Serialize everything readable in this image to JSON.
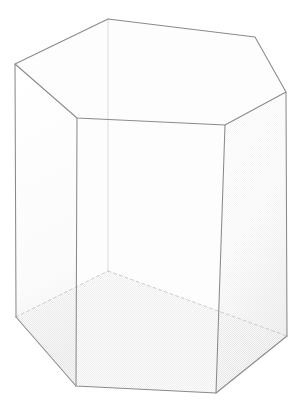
{
  "figure": {
    "kind": "line-drawing",
    "background_color": "#ffffff",
    "visible_edge_color": "#8a8a8a",
    "hidden_edge_color": "#c3c3c3",
    "faint_edge_color": "#d2d2d2",
    "shading_color": "#e9e9e9",
    "canvas": {
      "width": 304,
      "height": 403
    },
    "labels": [],
    "caption": ""
  },
  "geometry": {
    "solid": "hexagonal prism",
    "face_count": 8,
    "vertex_count": 12,
    "edge_count": 18,
    "top_face": {
      "name": "top-hexagon",
      "points": "15,64 108,19 255,37 286,92 225,125 77,118",
      "vertices": [
        {
          "name": "top-left",
          "x": 15,
          "y": 64
        },
        {
          "name": "top-back",
          "x": 108,
          "y": 19
        },
        {
          "name": "top-back-right",
          "x": 255,
          "y": 37
        },
        {
          "name": "top-right",
          "x": 286,
          "y": 92
        },
        {
          "name": "top-front-right",
          "x": 225,
          "y": 125
        },
        {
          "name": "top-front-left",
          "x": 77,
          "y": 118
        }
      ]
    },
    "bottom_face": {
      "name": "bottom-hexagon",
      "points": "16,317 108,271 287,336 216,393 76,386",
      "vertices": [
        {
          "name": "bottom-left",
          "x": 16,
          "y": 317
        },
        {
          "name": "bottom-back",
          "x": 108,
          "y": 271
        },
        {
          "name": "bottom-right",
          "x": 287,
          "y": 336
        },
        {
          "name": "bottom-front-right",
          "x": 216,
          "y": 393
        },
        {
          "name": "bottom-front-left",
          "x": 76,
          "y": 386
        }
      ]
    },
    "side_faces": [
      {
        "name": "face-left",
        "points": "15,64 77,118 76,386 16,317"
      },
      {
        "name": "face-front",
        "points": "77,118 225,125 216,393 76,386"
      },
      {
        "name": "face-right",
        "points": "225,125 286,92 287,336 216,393"
      }
    ],
    "vertical_edges": [
      {
        "name": "edge-left-vertical",
        "x1": 15,
        "y1": 64,
        "x2": 16,
        "y2": 317,
        "style": "visible"
      },
      {
        "name": "edge-front-left-vertical",
        "x1": 77,
        "y1": 118,
        "x2": 76,
        "y2": 386,
        "style": "visible"
      },
      {
        "name": "edge-front-right-vertical",
        "x1": 225,
        "y1": 125,
        "x2": 216,
        "y2": 393,
        "style": "visible"
      },
      {
        "name": "edge-right-vertical",
        "x1": 286,
        "y1": 92,
        "x2": 287,
        "y2": 336,
        "style": "visible"
      },
      {
        "name": "edge-back-vertical",
        "x1": 108,
        "y1": 19,
        "x2": 108,
        "y2": 271,
        "style": "faint"
      }
    ],
    "hidden_edges": [
      {
        "name": "edge-bottom-back-left",
        "x1": 16,
        "y1": 317,
        "x2": 108,
        "y2": 271,
        "style": "hidden"
      },
      {
        "name": "edge-bottom-back-right",
        "x1": 108,
        "y1": 271,
        "x2": 287,
        "y2": 336,
        "style": "hidden"
      }
    ],
    "visible_bottom_edges": [
      {
        "name": "edge-bottom-left-front",
        "x1": 16,
        "y1": 317,
        "x2": 76,
        "y2": 386
      },
      {
        "name": "edge-bottom-front",
        "x1": 76,
        "y1": 386,
        "x2": 216,
        "y2": 393
      },
      {
        "name": "edge-bottom-front-right",
        "x1": 216,
        "y1": 393,
        "x2": 287,
        "y2": 336
      }
    ]
  }
}
